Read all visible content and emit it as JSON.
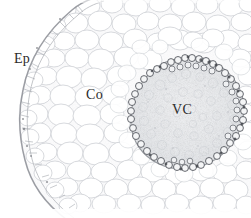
{
  "figure": {
    "kind": "light-micrograph",
    "background_color": "#ffffff",
    "cell_wall_color": "#c9ccd1",
    "endodermis_color": "#5b5e64",
    "epidermis_color": "#9a9da3",
    "vascular_fill_color": "#eceef0",
    "cortex_fill_color": "#fbfbfc",
    "label_color": "#2b2b2b"
  },
  "labels": {
    "epidermis": "Ep",
    "cortex": "Co",
    "vascular_cylinder": "VC"
  },
  "regions": {
    "epidermis": {
      "name": "Ep",
      "description": "outer cell layer forming the curved left boundary of the section"
    },
    "cortex": {
      "name": "Co",
      "description": "broad zone of large rounded parenchyma cells between epidermis and vascular cylinder"
    },
    "vascular_cylinder": {
      "name": "VC",
      "description": "central hexagonal stele bounded by a dark ring of small endodermal cells",
      "center_x": 189,
      "center_y": 113,
      "radius": 56
    }
  }
}
